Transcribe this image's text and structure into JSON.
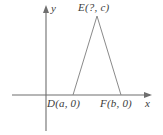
{
  "figure": {
    "background_color": "#ffffff",
    "line_color": "#6e6e6e",
    "text_color": "#3b3b3b",
    "axes": {
      "x_axis_label": "x",
      "y_axis_label": "y",
      "x_axis": {
        "y": 95,
        "x_start": 12,
        "x_end": 152,
        "arrow": "right"
      },
      "y_axis": {
        "x": 46,
        "y_start": 6,
        "y_end": 131,
        "arrow": "up"
      },
      "origin": {
        "x": 46,
        "y": 95
      }
    },
    "shape": {
      "type": "triangle",
      "name": "DEF",
      "vertices": [
        {
          "name": "D",
          "label": "D(a, 0)",
          "px": {
            "x": 73,
            "y": 95
          }
        },
        {
          "name": "E",
          "label": "E(?, c)",
          "px": {
            "x": 97,
            "y": 16
          }
        },
        {
          "name": "F",
          "label": "F(b, 0)",
          "px": {
            "x": 121,
            "y": 95
          }
        }
      ],
      "base_on_x_axis": true
    },
    "labels": {
      "apex": "E(?, c)",
      "base_left": "D(a, 0)",
      "base_right": "F(b, 0)",
      "x_axis": "x",
      "y_axis": "y"
    }
  }
}
